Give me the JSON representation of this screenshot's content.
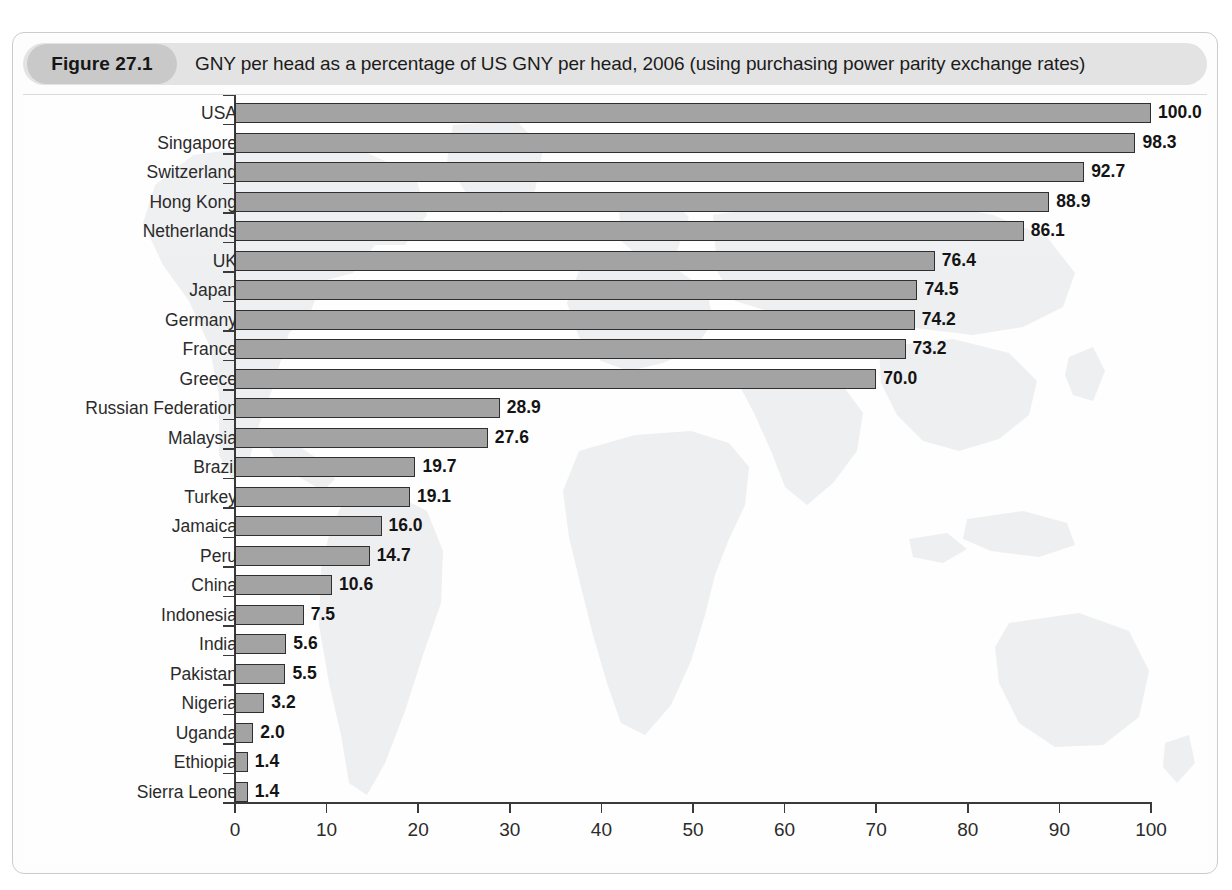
{
  "figure": {
    "badge": "Figure 27.1",
    "title": "GNY per head as a percentage of US GNY per head, 2006 (using purchasing power parity exchange rates)"
  },
  "colors": {
    "bar_fill": "#a3a3a3",
    "bar_stroke": "#2f2f2f",
    "axis": "#3a3a3a",
    "header_band": "#e3e3e3",
    "badge_band": "#c9c9c9",
    "frame_border": "#c9cccd",
    "map_watermark": "#e2e4e5"
  },
  "chart_data": {
    "type": "bar",
    "orientation": "horizontal",
    "title": "GNY per head as a percentage of US GNY per head, 2006 (using purchasing power parity exchange rates)",
    "xlabel": "",
    "ylabel": "",
    "xlim": [
      0,
      100
    ],
    "xticks": [
      0,
      10,
      20,
      30,
      40,
      50,
      60,
      70,
      80,
      90,
      100
    ],
    "grid": false,
    "legend": null,
    "value_labels": true,
    "categories": [
      "USA",
      "Singapore",
      "Switzerland",
      "Hong Kong",
      "Netherlands",
      "UK",
      "Japan",
      "Germany",
      "France",
      "Greece",
      "Russian Federation",
      "Malaysia",
      "Brazil",
      "Turkey",
      "Jamaica",
      "Peru",
      "China",
      "Indonesia",
      "India",
      "Pakistan",
      "Nigeria",
      "Uganda",
      "Ethiopia",
      "Sierra Leone"
    ],
    "values": [
      100.0,
      98.3,
      92.7,
      88.9,
      86.1,
      76.4,
      74.5,
      74.2,
      73.2,
      70.0,
      28.9,
      27.6,
      19.7,
      19.1,
      16.0,
      14.7,
      10.6,
      7.5,
      5.6,
      5.5,
      3.2,
      2.0,
      1.4,
      1.4
    ],
    "value_label_text": [
      "100.0",
      "98.3",
      "92.7",
      "88.9",
      "86.1",
      "76.4",
      "74.5",
      "74.2",
      "73.2",
      "70.0",
      "28.9",
      "27.6",
      "19.7",
      "19.1",
      "16.0",
      "14.7",
      "10.6",
      "7.5",
      "5.6",
      "5.5",
      "3.2",
      "2.0",
      "1.4",
      "1.4"
    ]
  }
}
